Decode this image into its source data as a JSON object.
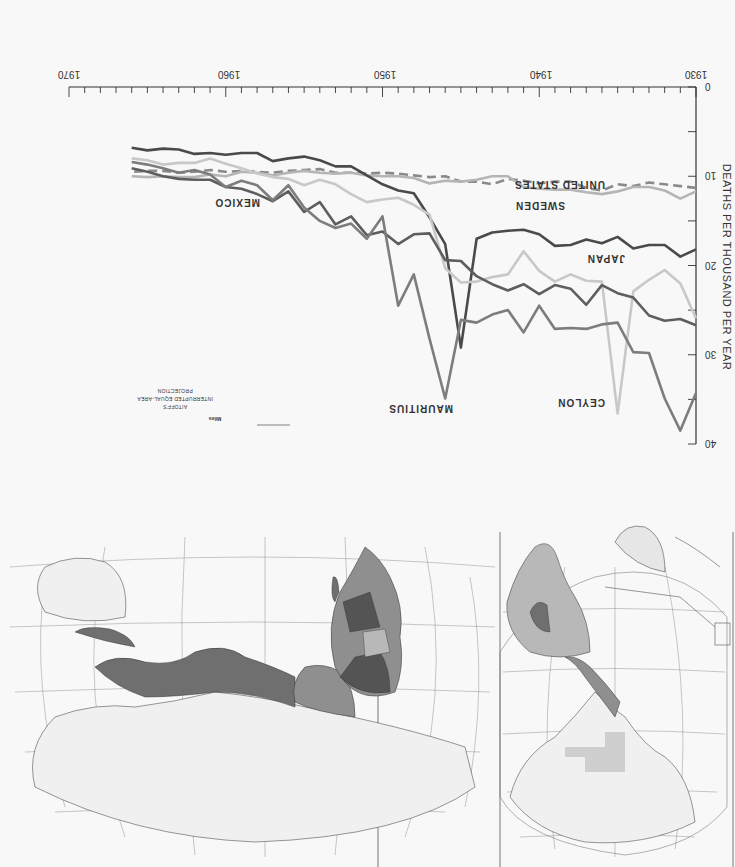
{
  "page": {
    "orientation": "rotated 180 degrees",
    "background": "#f8f8f8"
  },
  "chart_data": {
    "type": "line",
    "title": "",
    "xlabel": "",
    "ylabel": "DEATHS PER THOUSAND PER YEAR",
    "xlim": [
      1930,
      1970
    ],
    "ylim": [
      0,
      40
    ],
    "y_inverted_display": false,
    "x_ticks": [
      1930,
      1940,
      1950,
      1960,
      1970
    ],
    "y_ticks": [
      0,
      10,
      20,
      30,
      40
    ],
    "grid": false,
    "legend": "inline labels",
    "x": [
      1930,
      1931,
      1932,
      1933,
      1934,
      1935,
      1936,
      1937,
      1938,
      1939,
      1940,
      1941,
      1942,
      1943,
      1944,
      1945,
      1946,
      1947,
      1948,
      1949,
      1950,
      1951,
      1952,
      1953,
      1954,
      1955,
      1956,
      1957,
      1958,
      1959,
      1960,
      1961,
      1962,
      1963,
      1964,
      1965,
      1966
    ],
    "series": [
      {
        "name": "UNITED STATES",
        "style": "dashed",
        "color": "#8a8a8a",
        "values": [
          11.3,
          11.1,
          10.9,
          10.7,
          11.1,
          10.9,
          11.6,
          11.3,
          10.6,
          10.6,
          10.8,
          10.5,
          10.3,
          10.9,
          10.6,
          10.6,
          10.0,
          10.1,
          9.9,
          9.7,
          9.6,
          9.7,
          9.6,
          9.6,
          9.2,
          9.3,
          9.4,
          9.6,
          9.5,
          9.4,
          9.5,
          9.3,
          9.5,
          9.6,
          9.4,
          9.4,
          9.5
        ]
      },
      {
        "name": "SWEDEN",
        "style": "solid",
        "color": "#b5b5b5",
        "values": [
          11.7,
          12.5,
          11.6,
          11.2,
          11.2,
          11.7,
          12.0,
          11.8,
          11.5,
          11.5,
          11.4,
          11.2,
          10.0,
          10.0,
          10.4,
          10.6,
          10.5,
          10.8,
          10.2,
          10.0,
          10.0,
          9.9,
          9.6,
          9.7,
          9.6,
          9.4,
          9.6,
          9.9,
          9.6,
          9.5,
          10.0,
          9.8,
          10.1,
          10.1,
          10.0,
          10.1,
          10.0
        ]
      },
      {
        "name": "JAPAN",
        "style": "solid",
        "color": "#4a4a4a",
        "values": [
          18.2,
          19.0,
          17.7,
          17.7,
          18.1,
          16.8,
          17.5,
          17.1,
          17.7,
          17.8,
          16.5,
          16.0,
          16.1,
          16.3,
          17.0,
          29.2,
          17.6,
          14.6,
          11.9,
          11.6,
          10.9,
          9.9,
          8.9,
          8.9,
          8.2,
          7.8,
          8.0,
          8.3,
          7.4,
          7.4,
          7.6,
          7.4,
          7.5,
          7.0,
          6.9,
          7.1,
          6.8
        ]
      },
      {
        "name": "CEYLON",
        "style": "solid",
        "color": "#c8c8c8",
        "values": [
          25.9,
          22.0,
          20.5,
          21.6,
          22.9,
          36.6,
          21.8,
          21.7,
          21.0,
          21.8,
          20.6,
          18.4,
          21.0,
          21.3,
          21.8,
          21.9,
          20.3,
          14.3,
          13.2,
          12.4,
          12.6,
          12.9,
          12.0,
          10.9,
          10.4,
          11.0,
          10.3,
          10.1,
          9.7,
          9.1,
          8.6,
          8.0,
          8.5,
          8.5,
          8.7,
          8.2,
          8.0
        ]
      },
      {
        "name": "MEXICO",
        "style": "solid",
        "color": "#5e5e5e",
        "values": [
          26.7,
          26.0,
          26.2,
          25.6,
          23.6,
          23.1,
          22.2,
          24.4,
          22.6,
          22.2,
          23.2,
          22.1,
          22.8,
          22.1,
          21.2,
          19.5,
          19.4,
          16.4,
          16.5,
          17.6,
          16.2,
          16.6,
          14.5,
          15.4,
          12.9,
          14.0,
          11.7,
          12.8,
          12.0,
          11.4,
          11.2,
          10.4,
          10.4,
          10.3,
          10.0,
          9.5,
          9.1
        ]
      },
      {
        "name": "MAURITIUS",
        "style": "solid",
        "color": "#7d7d7d",
        "values": [
          34.3,
          38.5,
          34.9,
          29.8,
          29.7,
          26.4,
          26.6,
          27.1,
          27.0,
          27.1,
          24.5,
          27.5,
          25.0,
          25.5,
          26.4,
          26.1,
          34.9,
          28.2,
          21.0,
          24.5,
          14.5,
          17.0,
          15.3,
          15.8,
          15.0,
          13.5,
          11.0,
          12.7,
          11.0,
          10.5,
          11.2,
          9.8,
          9.3,
          9.6,
          9.1,
          8.7,
          8.4
        ]
      }
    ],
    "annotations": [
      {
        "text": "UNITED STATES",
        "x": 1936,
        "y": 10
      },
      {
        "text": "SWEDEN",
        "x": 1938.5,
        "y": 13
      },
      {
        "text": "JAPAN",
        "x": 1934.5,
        "y": 19.5
      },
      {
        "text": "CEYLON",
        "x": 1936,
        "y": 35
      },
      {
        "text": "MAURITIUS",
        "x": 1946,
        "y": 35.5
      },
      {
        "text": "MEXICO",
        "x": 1957,
        "y": 12.5
      }
    ]
  },
  "chart": {
    "y_axis_title": "DEATHS  PER THOUSAND  PER YEAR",
    "x_tick_labels": [
      "1930",
      "1940",
      "1950",
      "1960",
      "1970"
    ],
    "y_tick_labels": [
      "0",
      "10",
      "20",
      "30",
      "40"
    ],
    "labels": {
      "united_states": "UNITED STATES",
      "sweden": "SWEDEN",
      "japan": "JAPAN",
      "ceylon": "CEYLON",
      "mauritius": "MAURITIUS",
      "mexico": "MEXICO"
    }
  },
  "map": {
    "projection_line1": "AITOFF'S",
    "projection_line2": "INTERRUPTED EQUAL-AREA",
    "projection_line3": "PROJECTION",
    "scale": {
      "miles_title": "Miles",
      "miles_ticks": [
        "0",
        "500",
        "1000",
        "1500"
      ],
      "km_title": "Kilometers",
      "km_ticks": [
        "0",
        "500",
        "1000",
        "2000"
      ]
    },
    "shade_classes": [
      "#f0f0f0",
      "#e6e6e6",
      "#b8b8b8",
      "#8f8f8f",
      "#6f6f6f",
      "#545454"
    ]
  }
}
